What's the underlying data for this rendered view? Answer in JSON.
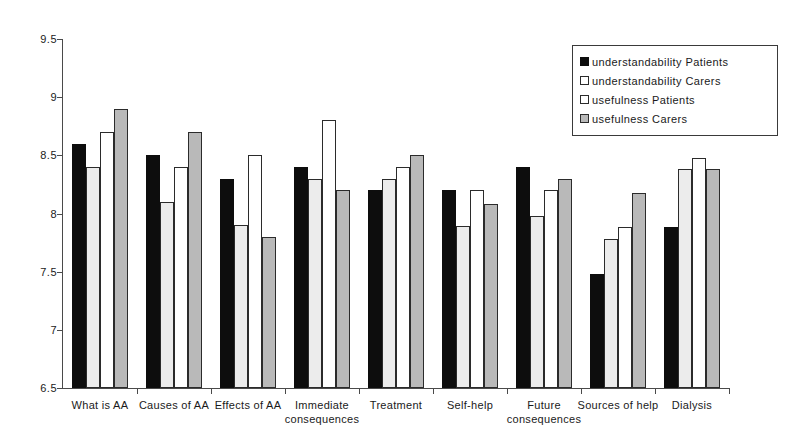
{
  "chart_data": {
    "type": "bar",
    "title": "",
    "xlabel": "",
    "ylabel": "",
    "ylim": [
      6.5,
      9.5
    ],
    "ytick_step": 0.5,
    "ytick_labels": [
      "9.5",
      "9",
      "8.5",
      "8",
      "7.5",
      "7",
      "6.5"
    ],
    "ytick_values": [
      9.5,
      9,
      8.5,
      8,
      7.5,
      7,
      6.5
    ],
    "grid": false,
    "legend_position": "top-right",
    "categories": [
      "What is AA",
      "Causes of AA",
      "Effects of AA",
      "Immediate consequences",
      "Treatment",
      "Self-help",
      "Future consequences",
      "Sources of help",
      "Dialysis"
    ],
    "series": [
      {
        "name": "understandability Patients",
        "color": "#0d0d0d",
        "values": [
          8.6,
          8.5,
          8.3,
          8.4,
          8.2,
          8.2,
          8.4,
          7.48,
          7.88
        ]
      },
      {
        "name": "understandability Carers",
        "color": "#ececec",
        "values": [
          8.4,
          8.1,
          7.9,
          8.3,
          8.3,
          7.89,
          7.98,
          7.78,
          8.38
        ]
      },
      {
        "name": "usefulness Patients",
        "color": "#ffffff",
        "values": [
          8.7,
          8.4,
          8.5,
          8.8,
          8.4,
          8.2,
          8.2,
          7.88,
          8.48
        ]
      },
      {
        "name": "usefulness Carers",
        "color": "#b9b9b9",
        "values": [
          8.9,
          8.7,
          7.8,
          8.2,
          8.5,
          8.08,
          8.3,
          8.18,
          8.38
        ]
      }
    ]
  }
}
